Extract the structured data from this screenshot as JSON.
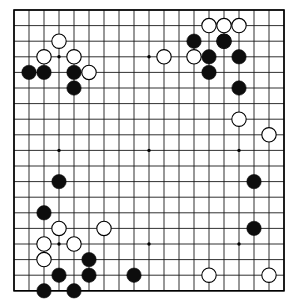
{
  "app": {
    "title": "Go Board Diagram",
    "board_name": "go-board"
  },
  "board": {
    "size": 19,
    "line_color": "#1a1a1a",
    "border_color": "#000000",
    "background_color": "#ffffff",
    "black_color": "#0d0d0d",
    "white_color": "#ffffff",
    "white_edge_color": "#000000",
    "star_point_color": "#000000",
    "geometry": {
      "origin_x": 14,
      "origin_y": 10,
      "step_x": 15.0,
      "step_y": 15.6,
      "stone_radius": 7.2,
      "border_width": 1.6,
      "line_width": 0.9,
      "star_radius": 1.7
    },
    "star_points": [
      [
        3,
        3
      ],
      [
        9,
        3
      ],
      [
        15,
        3
      ],
      [
        3,
        9
      ],
      [
        9,
        9
      ],
      [
        15,
        9
      ],
      [
        3,
        15
      ],
      [
        9,
        15
      ],
      [
        15,
        15
      ]
    ],
    "column_labels": [
      "A",
      "B",
      "C",
      "D",
      "E",
      "F",
      "G",
      "H",
      "J",
      "K",
      "L",
      "M",
      "N",
      "O",
      "P",
      "Q",
      "R",
      "S",
      "T"
    ],
    "row_labels": [
      "19",
      "18",
      "17",
      "16",
      "15",
      "14",
      "13",
      "12",
      "11",
      "10",
      "9",
      "8",
      "7",
      "6",
      "5",
      "4",
      "3",
      "2",
      "1"
    ]
  },
  "stones": {
    "black_count": 22,
    "white_count": 18,
    "black": [
      [
        1,
        4
      ],
      [
        2,
        4
      ],
      [
        4,
        4
      ],
      [
        4,
        5
      ],
      [
        12,
        2
      ],
      [
        14,
        2
      ],
      [
        13,
        3
      ],
      [
        15,
        3
      ],
      [
        13,
        4
      ],
      [
        15,
        5
      ],
      [
        3,
        11
      ],
      [
        2,
        13
      ],
      [
        16,
        11
      ],
      [
        16,
        14
      ],
      [
        5,
        16
      ],
      [
        3,
        17
      ],
      [
        5,
        17
      ],
      [
        2,
        18
      ],
      [
        4,
        18
      ],
      [
        8,
        17
      ]
    ],
    "white": [
      [
        3,
        2
      ],
      [
        2,
        3
      ],
      [
        4,
        3
      ],
      [
        5,
        4
      ],
      [
        13,
        1
      ],
      [
        14,
        1
      ],
      [
        15,
        1
      ],
      [
        14,
        2
      ],
      [
        12,
        3
      ],
      [
        10,
        3
      ],
      [
        15,
        7
      ],
      [
        17,
        8
      ],
      [
        4,
        15
      ],
      [
        3,
        14
      ],
      [
        6,
        14
      ],
      [
        2,
        15
      ],
      [
        2,
        16
      ],
      [
        13,
        17
      ],
      [
        17,
        17
      ]
    ]
  }
}
